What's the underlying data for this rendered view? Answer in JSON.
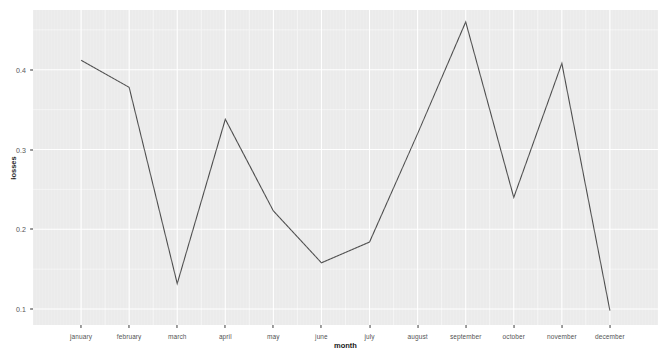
{
  "chart_data": {
    "type": "line",
    "title": "",
    "subtitle": "",
    "xlabel": "month",
    "ylabel": "losses",
    "categories": [
      "january",
      "february",
      "march",
      "april",
      "may",
      "june",
      "july",
      "august",
      "september",
      "october",
      "november",
      "december"
    ],
    "values": [
      0.412,
      0.378,
      0.132,
      0.338,
      0.223,
      0.158,
      0.184,
      0.32,
      0.46,
      0.24,
      0.408,
      0.098
    ],
    "series": [
      {
        "name": "losses",
        "values": [
          0.412,
          0.378,
          0.132,
          0.338,
          0.223,
          0.158,
          0.184,
          0.32,
          0.46,
          0.24,
          0.408,
          0.098
        ]
      }
    ],
    "ylim": [
      0.08,
      0.475
    ],
    "xlim": [
      0,
      13
    ],
    "y_ticks": [
      0.1,
      0.2,
      0.3,
      0.4
    ],
    "y_tick_labels": [
      "0.1",
      "0.2",
      "0.3",
      "0.4"
    ],
    "x_tick_labels": [
      "january",
      "february",
      "march",
      "april",
      "may",
      "june",
      "july",
      "august",
      "september",
      "october",
      "november",
      "december"
    ],
    "grid": true,
    "grid_color": "#ffffff",
    "panel_background": "#ebebeb",
    "line_color": "#4d4d4d",
    "legend": null,
    "legend_position": "none",
    "markers": false,
    "annotations": []
  },
  "axes": {
    "y_title": "losses",
    "x_title": "month"
  },
  "colors": {
    "panel": "#ebebeb",
    "grid_major": "#ffffff",
    "grid_minor": "#f5f5f5",
    "line": "#4d4d4d",
    "tick_text": "#4d4d4d",
    "axis_title": "#111111",
    "page_background": "#ffffff"
  }
}
